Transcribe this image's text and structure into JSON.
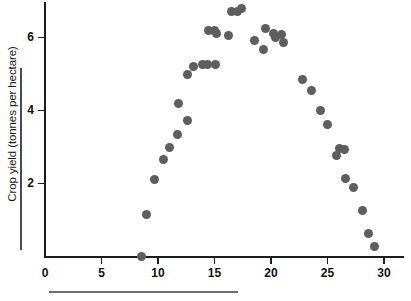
{
  "chart_data": {
    "type": "scatter",
    "title": "",
    "xlabel": "",
    "ylabel": "Crop yield (tonnes per hectare)",
    "xlim": [
      0,
      31.8
    ],
    "ylim": [
      0,
      7.0
    ],
    "xticks": [
      0,
      5,
      10,
      15,
      20,
      25,
      30
    ],
    "xtick_labels": [
      "0",
      "5",
      "10",
      "15",
      "20",
      "25",
      "30"
    ],
    "yticks": [
      2,
      4,
      6
    ],
    "ytick_labels": [
      "2",
      "4",
      "6"
    ],
    "grid": false,
    "legend": null,
    "marker_color": "#5e5e5e",
    "axis_color": "#1c1c1c",
    "points": [
      {
        "x": 8.5,
        "y": 0.0
      },
      {
        "x": 9.0,
        "y": 1.15
      },
      {
        "x": 9.7,
        "y": 2.1
      },
      {
        "x": 10.5,
        "y": 2.65
      },
      {
        "x": 11.0,
        "y": 3.0
      },
      {
        "x": 11.7,
        "y": 3.35
      },
      {
        "x": 11.8,
        "y": 4.2
      },
      {
        "x": 12.6,
        "y": 3.72
      },
      {
        "x": 12.6,
        "y": 5.0
      },
      {
        "x": 13.1,
        "y": 5.2
      },
      {
        "x": 13.9,
        "y": 5.27
      },
      {
        "x": 14.4,
        "y": 5.27
      },
      {
        "x": 15.1,
        "y": 5.27
      },
      {
        "x": 14.5,
        "y": 6.2
      },
      {
        "x": 15.0,
        "y": 6.2
      },
      {
        "x": 15.2,
        "y": 6.12
      },
      {
        "x": 16.2,
        "y": 6.05
      },
      {
        "x": 16.5,
        "y": 6.7
      },
      {
        "x": 17.0,
        "y": 6.72
      },
      {
        "x": 17.4,
        "y": 6.8
      },
      {
        "x": 18.5,
        "y": 5.93
      },
      {
        "x": 19.3,
        "y": 5.67
      },
      {
        "x": 19.5,
        "y": 6.25
      },
      {
        "x": 20.2,
        "y": 6.12
      },
      {
        "x": 20.4,
        "y": 6.0
      },
      {
        "x": 20.9,
        "y": 6.08
      },
      {
        "x": 21.1,
        "y": 5.85
      },
      {
        "x": 22.8,
        "y": 4.85
      },
      {
        "x": 23.6,
        "y": 4.55
      },
      {
        "x": 24.4,
        "y": 4.0
      },
      {
        "x": 25.0,
        "y": 3.62
      },
      {
        "x": 25.8,
        "y": 2.78
      },
      {
        "x": 26.1,
        "y": 2.95
      },
      {
        "x": 26.5,
        "y": 2.92
      },
      {
        "x": 26.6,
        "y": 2.15
      },
      {
        "x": 27.3,
        "y": 1.9
      },
      {
        "x": 28.1,
        "y": 1.25
      },
      {
        "x": 28.6,
        "y": 0.62
      },
      {
        "x": 29.2,
        "y": 0.28
      }
    ]
  }
}
